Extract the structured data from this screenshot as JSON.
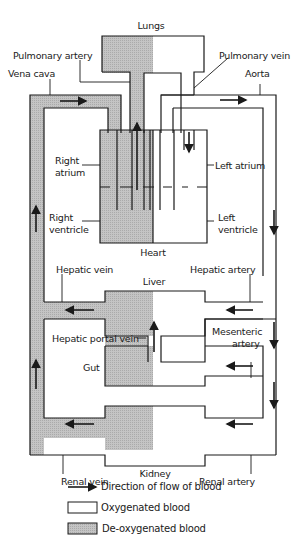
{
  "diagram": {
    "colors": {
      "deoxygenated_fill": "#bdbdbd",
      "oxygenated_fill": "#ffffff",
      "outline": "#1a1a1a"
    },
    "organs": {
      "lungs": "Lungs",
      "heart": "Heart",
      "liver": "Liver",
      "gut": "Gut",
      "kidney": "Kidney"
    },
    "heart_chambers": {
      "right_atrium": [
        "Right",
        "atrium"
      ],
      "right_ventricle": [
        "Right",
        "ventricle"
      ],
      "left_atrium": "Left atrium",
      "left_ventricle": [
        "Left",
        "ventricle"
      ]
    },
    "vessels": {
      "pulmonary_artery": "Pulmonary artery",
      "pulmonary_vein": "Pulmonary vein",
      "vena_cava": "Vena cava",
      "aorta": "Aorta",
      "hepatic_vein": "Hepatic vein",
      "hepatic_artery": "Hepatic artery",
      "hepatic_portal_vein": "Hepatic portal vein",
      "mesenteric_artery": [
        "Mesenteric",
        "artery"
      ],
      "renal_vein": "Renal vein",
      "renal_artery": "Renal artery"
    },
    "legend": [
      {
        "symbol": "arrow",
        "label": "Direction of flow of blood"
      },
      {
        "symbol": "white-box",
        "label": "Oxygenated blood"
      },
      {
        "symbol": "gray-box",
        "label": "De-oxygenated blood"
      }
    ]
  }
}
